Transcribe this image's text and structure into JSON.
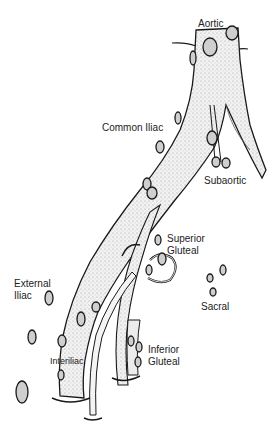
{
  "figure": {
    "colors": {
      "vessel_fill": "#eeeeee",
      "vessel_stipple": "#9a9a9a",
      "outline": "#1a1a1a",
      "node_fill": "#cfcfcf",
      "label": "#222222",
      "background": "#ffffff"
    },
    "labels": {
      "aortic": "Aortic",
      "common_iliac": "Common Iliac",
      "subaortic": "Subaortic",
      "superior_gluteal_line1": "Superior",
      "superior_gluteal_line2": "Gluteal",
      "sacral": "Sacral",
      "external_iliac_line1": "External",
      "external_iliac_line2": "Iliac",
      "interiliac": "Interiliac",
      "inferior_gluteal_line1": "Inferior",
      "inferior_gluteal_line2": "Gluteal"
    }
  }
}
